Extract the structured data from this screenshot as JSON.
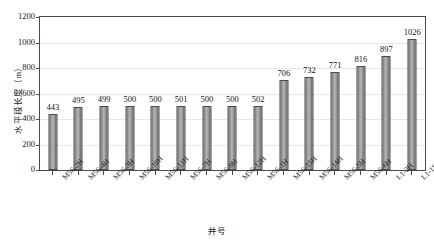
{
  "chart_data": {
    "type": "bar",
    "title": "",
    "xlabel": "井号",
    "ylabel": "水平段长度（m）",
    "ylim": [
      0,
      1200
    ],
    "yticks": [
      1200,
      1000,
      800,
      600,
      400,
      200,
      0
    ],
    "grid": "horizontal",
    "legend": "none",
    "categories": [
      "M56-2H",
      "M56-4H",
      "M56-3H",
      "M56-10H",
      "M56-11H",
      "M56-7H",
      "M56-9H",
      "M56-12H",
      "M56-1H",
      "M56-15H",
      "M56-14H",
      "M56-5H",
      "M56-6H",
      "L1-2H",
      "L1-1H"
    ],
    "values": [
      443,
      495,
      499,
      500,
      500,
      501,
      500,
      500,
      502,
      706,
      732,
      771,
      816,
      897,
      1026
    ],
    "value_labels": [
      "443",
      "495",
      "499",
      "500",
      "500",
      "501",
      "500",
      "500",
      "502",
      "706",
      "732",
      "771",
      "816",
      "897",
      "1026"
    ],
    "series_name": "水平段长度",
    "bar_color": "#a8a8a8",
    "bar_edge_color": "#4b4b4b",
    "axis_color": "#4a4a4a",
    "grid_color": "#e8e8e8"
  }
}
